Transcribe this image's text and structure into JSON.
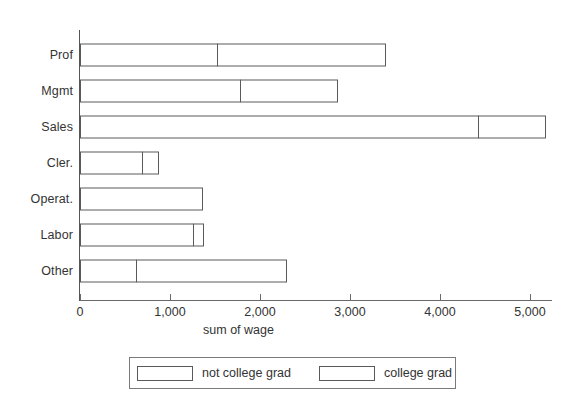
{
  "chart_data": {
    "type": "bar",
    "orientation": "horizontal",
    "stacked": true,
    "title": "",
    "xlabel": "sum of wage",
    "ylabel": "",
    "xlim": [
      0,
      5300
    ],
    "xticks": [
      0,
      1000,
      2000,
      3000,
      4000,
      5000
    ],
    "xtick_labels": [
      "0",
      "1,000",
      "2,000",
      "3,000",
      "4,000",
      "5,000"
    ],
    "grid": false,
    "legend_position": "bottom",
    "categories": [
      "Prof",
      "Mgmt",
      "Sales",
      "Cler.",
      "Operat.",
      "Labor",
      "Other"
    ],
    "series": [
      {
        "name": "not college grad",
        "values": [
          1533,
          1789,
          4433,
          700,
          1367,
          1267,
          633
        ]
      },
      {
        "name": "college grad",
        "values": [
          1878,
          1089,
          756,
          189,
          0,
          122,
          1678
        ]
      }
    ],
    "totals": [
      3411,
      2878,
      5189,
      889,
      1367,
      1389,
      2311
    ],
    "colors": {
      "bar_fill": "#ffffff",
      "bar_border": "#5a5a5a",
      "axis": "#6a6a6a",
      "text": "#333333"
    }
  },
  "legend": {
    "items": [
      {
        "label": "not college grad"
      },
      {
        "label": "college grad"
      }
    ]
  }
}
